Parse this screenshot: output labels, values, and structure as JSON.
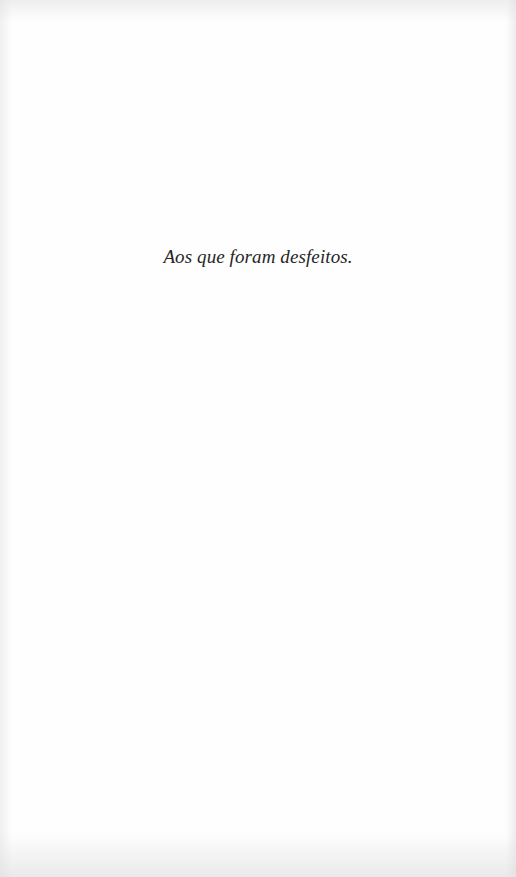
{
  "page": {
    "type": "dedication",
    "dedication_text": "Aos que foram desfeitos.",
    "colors": {
      "paper": "#fefefe",
      "text": "#262626"
    }
  }
}
